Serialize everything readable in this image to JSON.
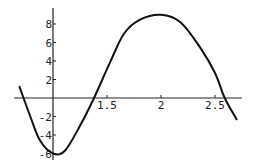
{
  "chart_data": {
    "type": "line",
    "title": "",
    "xlabel": "",
    "ylabel": "",
    "xlim": [
      0.69,
      2.75
    ],
    "ylim": [
      -6.5,
      9.5
    ],
    "grid": false,
    "legend": null,
    "axis_origin": {
      "x": 1,
      "y": 0
    },
    "x_ticks": [
      1.5,
      2,
      2.5
    ],
    "x_tick_labels": [
      "1.5",
      "2",
      "2.5"
    ],
    "y_ticks": [
      -6,
      -4,
      -2,
      2,
      4,
      6,
      8
    ],
    "y_tick_labels": [
      "-6",
      "-4",
      "-2",
      "2",
      "4",
      "6",
      "8"
    ],
    "series": [
      {
        "name": "f(x)",
        "color": "#111111",
        "x": [
          0.69,
          0.79,
          0.88,
          1.0,
          1.11,
          1.25,
          1.38,
          1.53,
          1.66,
          1.81,
          2.0,
          2.18,
          2.36,
          2.5,
          2.59,
          2.7
        ],
        "y": [
          1.2,
          -2.0,
          -4.6,
          -6.0,
          -5.7,
          -3.0,
          0.0,
          3.9,
          7.0,
          8.5,
          9.0,
          8.2,
          5.5,
          2.7,
          0.0,
          -2.3
        ]
      }
    ]
  }
}
